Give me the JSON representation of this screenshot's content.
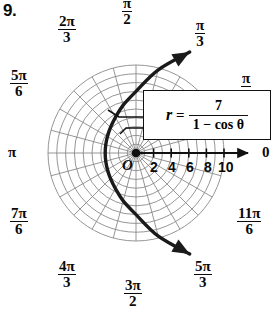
{
  "problem_number": "9.",
  "chart_data": {
    "type": "line",
    "plot_kind": "polar",
    "title": "",
    "equation_display": {
      "lhs": "r",
      "equals": "=",
      "numerator": "7",
      "denominator": "1 − cos θ",
      "plain": "r = 7 / (1 − cos θ)"
    },
    "polar": {
      "center_label": "O",
      "radial_ticks": [
        "2",
        "4",
        "6",
        "8",
        "10"
      ],
      "radial_max": 10,
      "circle_count": 10,
      "spoke_step_degrees": 15,
      "grid": true,
      "axis_label_zero": "0"
    },
    "angle_labels": [
      {
        "name": "zero",
        "text": "0",
        "style": "plain",
        "angle_deg": 0
      },
      {
        "name": "pi-over-6",
        "num": "π",
        "den": "6",
        "style": "fraction",
        "angle_deg": 30,
        "clipped": true
      },
      {
        "name": "pi-over-3",
        "num": "π",
        "den": "3",
        "style": "fraction",
        "angle_deg": 60
      },
      {
        "name": "pi-over-2",
        "num": "π",
        "den": "2",
        "style": "fraction",
        "angle_deg": 90,
        "clipped": true
      },
      {
        "name": "two-pi-over-3",
        "num": "2π",
        "den": "3",
        "style": "fraction",
        "angle_deg": 120
      },
      {
        "name": "five-pi-over-6",
        "num": "5π",
        "den": "6",
        "style": "fraction",
        "angle_deg": 150
      },
      {
        "name": "pi",
        "text": "π",
        "style": "plain",
        "angle_deg": 180
      },
      {
        "name": "seven-pi-over-6",
        "num": "7π",
        "den": "6",
        "style": "fraction",
        "angle_deg": 210
      },
      {
        "name": "four-pi-over-3",
        "num": "4π",
        "den": "3",
        "style": "fraction",
        "angle_deg": 240
      },
      {
        "name": "three-pi-over-2",
        "num": "3π",
        "den": "2",
        "style": "fraction",
        "angle_deg": 270
      },
      {
        "name": "five-pi-over-3",
        "num": "5π",
        "den": "3",
        "style": "fraction",
        "angle_deg": 300
      },
      {
        "name": "eleven-pi-over-6",
        "num": "11π",
        "den": "6",
        "style": "fraction",
        "angle_deg": 330
      }
    ],
    "curve": {
      "name": "conic-parabola",
      "equation": "r = 7/(1 - cos(theta))",
      "eccentricity": 1,
      "semi_latus_rectum": 7,
      "vertex_cartesian": [
        -3.5,
        0
      ],
      "opens": "left",
      "arrowheads": [
        "start",
        "end"
      ],
      "theta_range_deg": [
        62,
        298
      ],
      "points_polar": [
        {
          "theta_deg": 62,
          "r": 13.0
        },
        {
          "theta_deg": 75,
          "r": 9.78
        },
        {
          "theta_deg": 90,
          "r": 7.0
        },
        {
          "theta_deg": 105,
          "r": 5.63
        },
        {
          "theta_deg": 120,
          "r": 4.67
        },
        {
          "theta_deg": 135,
          "r": 4.1
        },
        {
          "theta_deg": 150,
          "r": 3.75
        },
        {
          "theta_deg": 165,
          "r": 3.56
        },
        {
          "theta_deg": 180,
          "r": 3.5
        },
        {
          "theta_deg": 195,
          "r": 3.56
        },
        {
          "theta_deg": 210,
          "r": 3.75
        },
        {
          "theta_deg": 225,
          "r": 4.1
        },
        {
          "theta_deg": 240,
          "r": 4.67
        },
        {
          "theta_deg": 255,
          "r": 5.63
        },
        {
          "theta_deg": 270,
          "r": 7.0
        },
        {
          "theta_deg": 285,
          "r": 9.78
        },
        {
          "theta_deg": 298,
          "r": 13.0
        }
      ]
    },
    "callout": {
      "has_leader_line": true,
      "leader_target": "curve"
    }
  }
}
